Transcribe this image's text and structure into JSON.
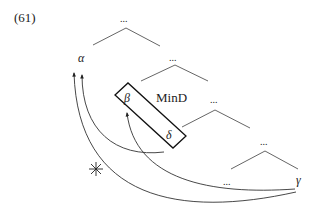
{
  "example_number": "(61)",
  "nodes": {
    "top_ellipsis": "...",
    "alpha": "α",
    "second_ellipsis": "...",
    "beta": "β",
    "delta": "δ",
    "mind_label": "MinD",
    "third_ellipsis": "...",
    "fourth_ellipsis": "...",
    "bottom_ellipsis": "...",
    "gamma": "γ"
  },
  "arrows": [
    {
      "from": "delta",
      "to": "alpha",
      "blocked": false
    },
    {
      "from": "gamma",
      "to": "beta",
      "blocked": false
    },
    {
      "from": "gamma",
      "to": "alpha",
      "blocked": true
    }
  ],
  "blocked_marker": "*",
  "colors": {
    "tree_lines": "#666666",
    "arrows": "#333333",
    "box": "#111111"
  }
}
